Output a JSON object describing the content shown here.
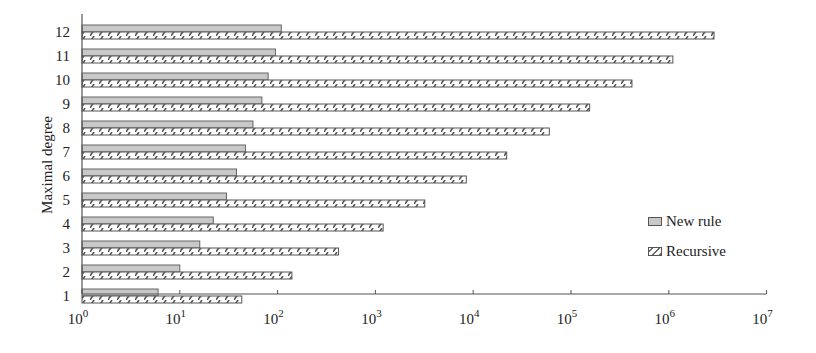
{
  "chart_data": {
    "type": "bar",
    "orientation": "horizontal",
    "xscale": "log",
    "title": "",
    "xlabel": "",
    "ylabel": "Maximal degree",
    "categories": [
      "1",
      "2",
      "3",
      "4",
      "5",
      "6",
      "7",
      "8",
      "9",
      "10",
      "11",
      "12"
    ],
    "series": [
      {
        "name": "New rule",
        "fill": "#c8c8c8",
        "values": [
          6,
          10,
          16,
          22,
          30,
          38,
          47,
          56,
          69,
          80,
          95,
          109
        ]
      },
      {
        "name": "Recursive",
        "fill": "hatched",
        "values": [
          43,
          140,
          420,
          1200,
          3200,
          8500,
          22000,
          60000,
          155000,
          420000,
          1100000,
          2900000
        ]
      }
    ],
    "xlim": [
      1,
      10000000
    ],
    "xticks": [
      "10^0",
      "10^1",
      "10^2",
      "10^3",
      "10^4",
      "10^5",
      "10^6",
      "10^7"
    ],
    "grid": false,
    "legend_position": "right"
  },
  "legend": {
    "items": [
      "New rule",
      "Recursive"
    ]
  }
}
